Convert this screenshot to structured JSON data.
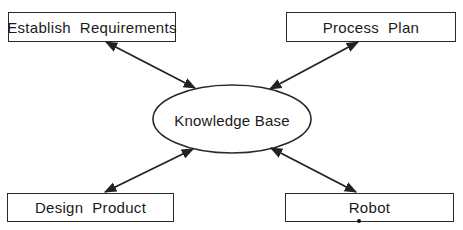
{
  "diagram": {
    "center": {
      "label": "Knowledge Base",
      "shape": "ellipse",
      "cx": 232,
      "cy": 119,
      "rx": 79,
      "ry": 34
    },
    "nodes": [
      {
        "id": "establish",
        "label": "Establish  Requirements",
        "x": 8,
        "y": 12,
        "w": 168,
        "h": 30
      },
      {
        "id": "process",
        "label": "Process  Plan",
        "x": 286,
        "y": 12,
        "w": 170,
        "h": 30
      },
      {
        "id": "design",
        "label": "Design  Product",
        "x": 7,
        "y": 193,
        "w": 167,
        "h": 29
      },
      {
        "id": "robot",
        "label": "Robot",
        "x": 285,
        "y": 193,
        "w": 169,
        "h": 29
      }
    ],
    "edges": [
      {
        "from": "establish",
        "to": "center",
        "direction": "bidirectional",
        "x1": 106,
        "y1": 42,
        "x2": 195,
        "y2": 88
      },
      {
        "from": "process",
        "to": "center",
        "direction": "bidirectional",
        "x1": 358,
        "y1": 42,
        "x2": 270,
        "y2": 89
      },
      {
        "from": "design",
        "to": "center",
        "direction": "bidirectional",
        "x1": 105,
        "y1": 192,
        "x2": 193,
        "y2": 149
      },
      {
        "from": "robot",
        "to": "center",
        "direction": "bidirectional",
        "x1": 356,
        "y1": 192,
        "x2": 271,
        "y2": 148
      }
    ],
    "colors": {
      "stroke": "#2a2a2a",
      "text": "#1a1a1a",
      "background": "#ffffff"
    }
  }
}
